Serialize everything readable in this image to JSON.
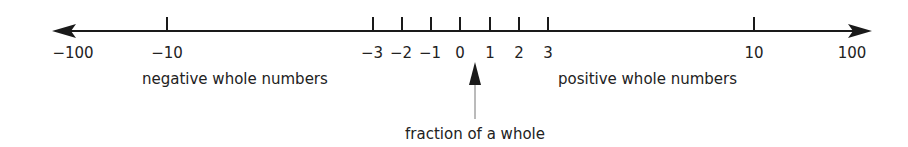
{
  "diagram": {
    "axis": {
      "min_label": "−100",
      "max_label": "100",
      "ticks": [
        {
          "value": -10,
          "label": "−10",
          "x": 167
        },
        {
          "value": -3,
          "label": "−3",
          "x": 373
        },
        {
          "value": -2,
          "label": "−2",
          "x": 402
        },
        {
          "value": -1,
          "label": "−1",
          "x": 431
        },
        {
          "value": 0,
          "label": "0",
          "x": 460
        },
        {
          "value": 1,
          "label": "1",
          "x": 490
        },
        {
          "value": 2,
          "label": "2",
          "x": 519
        },
        {
          "value": 3,
          "label": "3",
          "x": 548
        },
        {
          "value": 10,
          "label": "10",
          "x": 754
        }
      ]
    },
    "labels": {
      "negative": "negative whole numbers",
      "positive": "positive whole numbers",
      "fraction": "fraction of a whole"
    },
    "colors": {
      "line": "#1a1a1a",
      "text": "#222222",
      "pointer_stem": "#777777"
    }
  }
}
